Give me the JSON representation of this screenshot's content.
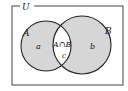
{
  "diagram": {
    "type": "venn",
    "universe_label": "U",
    "sets": [
      {
        "name": "A",
        "region_label": "a"
      },
      {
        "name": "B",
        "region_label": "b"
      }
    ],
    "intersection": {
      "label": "A∩B",
      "region_label": "c"
    },
    "colors": {
      "shaded": "#d6d6d6",
      "intersection": "#ffffff",
      "stroke": "#222222",
      "border": "#444444"
    }
  }
}
